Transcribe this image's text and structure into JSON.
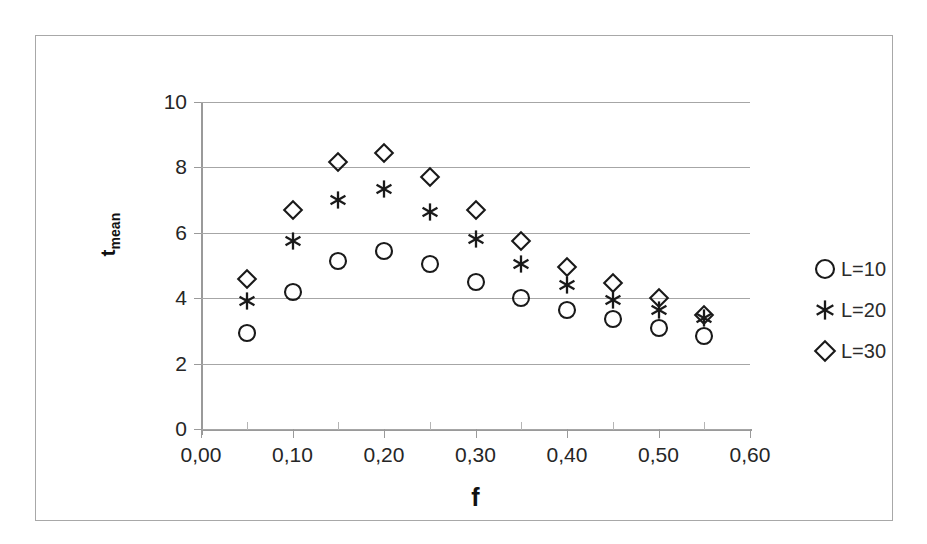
{
  "chart_data": {
    "type": "scatter",
    "title": "",
    "xlabel": "f",
    "ylabel": "t_mean",
    "ylabel_base": "t",
    "ylabel_sub": "mean",
    "xlim": [
      0.0,
      0.6
    ],
    "ylim": [
      0,
      10
    ],
    "x_tick_labels": [
      "0,00",
      "0,10",
      "0,20",
      "0,30",
      "0,40",
      "0,50",
      "0,60"
    ],
    "x_tick_values": [
      0.0,
      0.1,
      0.2,
      0.3,
      0.4,
      0.5,
      0.6
    ],
    "x_minor_tick_values": [
      0.05,
      0.15,
      0.25,
      0.35,
      0.45,
      0.55
    ],
    "y_tick_labels": [
      "10",
      "8",
      "6",
      "4",
      "2",
      "0"
    ],
    "y_tick_values": [
      10,
      8,
      6,
      4,
      2,
      0
    ],
    "grid": "horizontal",
    "legend_position": "right",
    "x": [
      0.05,
      0.1,
      0.15,
      0.2,
      0.25,
      0.3,
      0.35,
      0.4,
      0.45,
      0.5,
      0.55
    ],
    "series": [
      {
        "name": "L=10",
        "marker": "circle",
        "values": [
          2.95,
          4.2,
          5.15,
          5.45,
          5.05,
          4.5,
          4.0,
          3.65,
          3.35,
          3.1,
          2.85
        ]
      },
      {
        "name": "L=20",
        "marker": "asterisk",
        "values": [
          3.9,
          5.75,
          7.0,
          7.35,
          6.65,
          5.8,
          5.05,
          4.4,
          3.95,
          3.65,
          3.4
        ]
      },
      {
        "name": "L=30",
        "marker": "diamond",
        "values": [
          4.6,
          6.7,
          8.15,
          8.45,
          7.7,
          6.7,
          5.75,
          4.95,
          4.45,
          4.0,
          3.5
        ]
      }
    ]
  },
  "legend": {
    "items": [
      {
        "label": "L=10",
        "marker": "circle"
      },
      {
        "label": "L=20",
        "marker": "asterisk"
      },
      {
        "label": "L=30",
        "marker": "diamond"
      }
    ]
  },
  "colors": {
    "marker": "#1a1a1a",
    "gridline": "#a6a6a6",
    "axis": "#9a9a9a",
    "frame": "#a8a8a8",
    "background": "#ffffff",
    "text": "#262626"
  }
}
